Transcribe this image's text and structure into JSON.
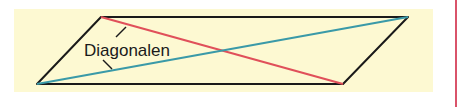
{
  "diagram": {
    "label": "Diagonalen",
    "shape": "parallelogram",
    "colors": {
      "background_panel": "#fdf9d2",
      "outline": "#1a1a1a",
      "diagonal_1": "#e0505a",
      "diagonal_2": "#3a9aa8",
      "margin_line": "#d9536a"
    }
  }
}
